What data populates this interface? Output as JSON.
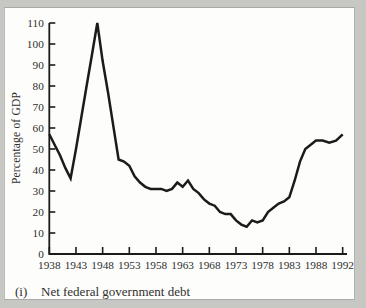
{
  "frame": {
    "background_color": "#c7c7c3",
    "panel_color": "#fdfdfc"
  },
  "chart_data": {
    "type": "line",
    "title": "",
    "xlabel": "",
    "ylabel": "Percentage of GDP",
    "caption_index": "(i)",
    "caption_text": "Net federal government debt",
    "grid": false,
    "legend": "none",
    "ylim": [
      0,
      110
    ],
    "y_tick_labels": [
      "0",
      "10",
      "20",
      "30",
      "40",
      "50",
      "60",
      "70",
      "80",
      "90",
      "100",
      "110"
    ],
    "x_tick_labels": [
      "1938",
      "1943",
      "1948",
      "1953",
      "1958",
      "1963",
      "1968",
      "1973",
      "1978",
      "1983",
      "1988",
      "1992"
    ],
    "line_color": "#1b1b1b",
    "axis_color": "#1b1b1b",
    "series": [
      {
        "name": "Net federal government debt (% of GDP)",
        "x": [
          1938,
          1939,
          1940,
          1941,
          1942,
          1943,
          1944,
          1945,
          1946,
          1947,
          1948,
          1949,
          1950,
          1951,
          1952,
          1953,
          1954,
          1955,
          1956,
          1957,
          1958,
          1959,
          1960,
          1961,
          1962,
          1963,
          1964,
          1965,
          1966,
          1967,
          1968,
          1969,
          1970,
          1971,
          1972,
          1973,
          1974,
          1975,
          1976,
          1977,
          1978,
          1979,
          1980,
          1981,
          1982,
          1983,
          1984,
          1985,
          1986,
          1987,
          1988,
          1989,
          1990,
          1991,
          1992
        ],
        "values": [
          57,
          52,
          47,
          41,
          36,
          50,
          65,
          80,
          95,
          110,
          92,
          77,
          61,
          45,
          44,
          42,
          37,
          34,
          32,
          31,
          31,
          31,
          30,
          31,
          34,
          32,
          35,
          31,
          29,
          26,
          24,
          23,
          20,
          19,
          19,
          16,
          14,
          13,
          16,
          15,
          16,
          20,
          22,
          24,
          25,
          27,
          35,
          44,
          50,
          52,
          54,
          54,
          53,
          54,
          57
        ]
      }
    ]
  }
}
